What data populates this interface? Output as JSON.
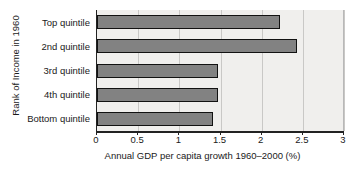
{
  "chart_data": {
    "type": "bar",
    "orientation": "horizontal",
    "title": "",
    "xlabel": "Annual GDP per capita growth 1960–2000 (%)",
    "ylabel": "Rank of Income in 1960",
    "categories": [
      "Top quintile",
      "2nd quintile",
      "3rd quintile",
      "4th quintile",
      "Bottom quintile"
    ],
    "values": [
      2.22,
      2.43,
      1.47,
      1.47,
      1.41
    ],
    "xlim": [
      0,
      3
    ],
    "xticks": [
      0,
      0.5,
      1,
      1.5,
      2,
      2.5,
      3
    ],
    "xtick_labels": [
      "0",
      "0.5",
      "1",
      "1.5",
      "2",
      "2.5",
      "3"
    ],
    "grid": "vertical",
    "legend": null,
    "colors": {
      "bar_fill": "#828282",
      "bar_border": "#121212",
      "plot_background": "#f0efed",
      "page_background": "#ffffff",
      "gridline": "#c9c8c6",
      "axis": "#222222",
      "text": "#1a1a1a"
    }
  }
}
